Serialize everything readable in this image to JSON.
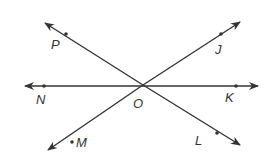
{
  "diagram": {
    "type": "intersecting-lines",
    "stroke_color": "#333333",
    "background": "#ffffff",
    "center_point": {
      "label": "O",
      "x": 143,
      "y": 85
    },
    "lines": [
      {
        "name": "line-NK",
        "from": {
          "x": 25,
          "y": 86
        },
        "to": {
          "x": 258,
          "y": 86
        },
        "points": [
          {
            "label": "N",
            "x": 44,
            "y": 86
          },
          {
            "label": "K",
            "x": 236,
            "y": 86
          }
        ]
      },
      {
        "name": "line-PL",
        "from": {
          "x": 45,
          "y": 23
        },
        "to": {
          "x": 240,
          "y": 145
        },
        "points": [
          {
            "label": "P",
            "x": 66,
            "y": 34
          },
          {
            "label": "L",
            "x": 217,
            "y": 133
          }
        ]
      },
      {
        "name": "line-JM",
        "from": {
          "x": 48,
          "y": 150
        },
        "to": {
          "x": 240,
          "y": 22
        },
        "points": [
          {
            "label": "M",
            "x": 72,
            "y": 142
          },
          {
            "label": "J",
            "x": 221,
            "y": 34
          }
        ]
      }
    ],
    "labels": {
      "P": "P",
      "J": "J",
      "N": "N",
      "K": "K",
      "O": "O",
      "M": "M",
      "L": "L"
    }
  }
}
